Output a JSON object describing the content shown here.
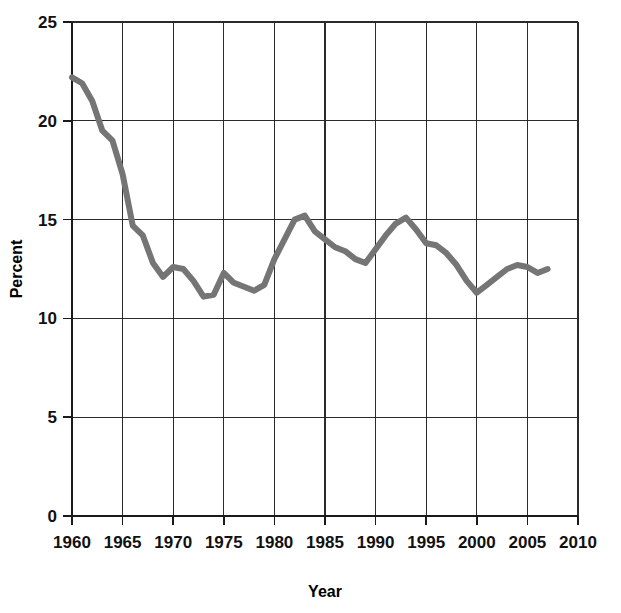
{
  "chart_data": {
    "type": "line",
    "title": "",
    "xlabel": "Year",
    "ylabel": "Percent",
    "xlim": [
      1960,
      2010
    ],
    "ylim": [
      0,
      25
    ],
    "xticks": [
      1960,
      1965,
      1970,
      1975,
      1980,
      1985,
      1990,
      1995,
      2000,
      2005,
      2010
    ],
    "yticks": [
      0,
      5,
      10,
      15,
      20,
      25
    ],
    "xtick_labels": [
      "1960",
      "1965",
      "1970",
      "1975",
      "1980",
      "1985",
      "1990",
      "1995",
      "2000",
      "2005",
      "2010"
    ],
    "ytick_labels": [
      "0",
      "5",
      "10",
      "15",
      "20",
      "25"
    ],
    "grid": true,
    "legend": "none",
    "series": [
      {
        "name": "Percent",
        "color": "#757575",
        "line_width": 6,
        "x": [
          1960,
          1961,
          1962,
          1963,
          1964,
          1965,
          1966,
          1967,
          1968,
          1969,
          1970,
          1971,
          1972,
          1973,
          1974,
          1975,
          1976,
          1977,
          1978,
          1979,
          1980,
          1981,
          1982,
          1983,
          1984,
          1985,
          1986,
          1987,
          1988,
          1989,
          1990,
          1991,
          1992,
          1993,
          1994,
          1995,
          1996,
          1997,
          1998,
          1999,
          2000,
          2001,
          2002,
          2003,
          2004,
          2005,
          2006,
          2007
        ],
        "y": [
          22.2,
          21.9,
          21.0,
          19.5,
          19.0,
          17.3,
          14.7,
          14.2,
          12.8,
          12.1,
          12.6,
          12.5,
          11.9,
          11.1,
          11.2,
          12.3,
          11.8,
          11.6,
          11.4,
          11.7,
          13.0,
          14.0,
          15.0,
          15.2,
          14.4,
          14.0,
          13.6,
          13.4,
          13.0,
          12.8,
          13.5,
          14.2,
          14.8,
          15.1,
          14.5,
          13.8,
          13.7,
          13.3,
          12.7,
          11.9,
          11.3,
          11.7,
          12.1,
          12.5,
          12.7,
          12.6,
          12.3,
          12.5
        ]
      }
    ]
  },
  "axes": {
    "y_axis_title": "Percent",
    "x_axis_title": "Year"
  }
}
